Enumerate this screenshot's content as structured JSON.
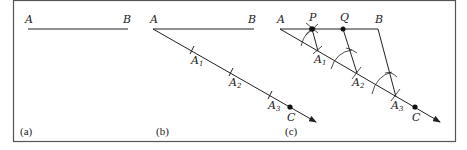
{
  "figure": {
    "panels": [
      {
        "caption": "(a)",
        "points": {
          "A": "A",
          "B": "B"
        }
      },
      {
        "caption": "(b)",
        "points": {
          "A": "A",
          "B": "B",
          "A1": "A",
          "A1_sub": "1",
          "A2": "A",
          "A2_sub": "2",
          "A3": "A",
          "A3_sub": "3",
          "C": "C"
        }
      },
      {
        "caption": "(c)",
        "points": {
          "A": "A",
          "P": "P",
          "Q": "Q",
          "B": "B",
          "A1": "A",
          "A1_sub": "1",
          "A2": "A",
          "A2_sub": "2",
          "A3": "A",
          "A3_sub": "3",
          "C": "C"
        }
      }
    ],
    "colors": {
      "stroke": "#222222",
      "frame": "#555555",
      "background": "#ffffff"
    }
  }
}
